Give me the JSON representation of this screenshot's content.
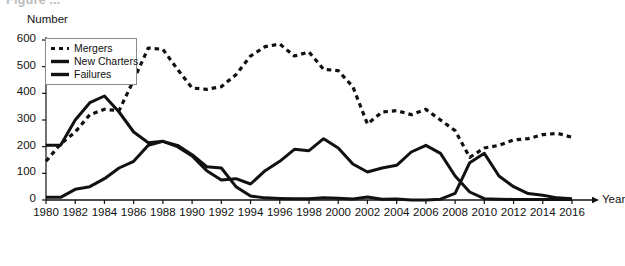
{
  "figure": {
    "cropped_title_fragment": "Figure ..."
  },
  "axes": {
    "ylabel": "Number",
    "xlabel": "Year",
    "yticks": [
      0,
      100,
      200,
      300,
      400,
      500,
      600
    ],
    "xticks": [
      1980,
      1982,
      1984,
      1986,
      1988,
      1990,
      1992,
      1994,
      1996,
      1998,
      2000,
      2002,
      2004,
      2006,
      2008,
      2010,
      2012,
      2014,
      2016
    ]
  },
  "legend": {
    "items": [
      {
        "label": "Mergers",
        "style": "dashed",
        "color": "#111111"
      },
      {
        "label": "New Charters",
        "style": "solid",
        "color": "#111111"
      },
      {
        "label": "Failures",
        "style": "solid",
        "color": "#111111"
      }
    ]
  },
  "chart_data": {
    "type": "line",
    "title": "",
    "xlabel": "Year",
    "ylabel": "Number",
    "xlim": [
      1980,
      2016
    ],
    "ylim": [
      0,
      600
    ],
    "grid": false,
    "legend_position": "top-left",
    "x": [
      1980,
      1981,
      1982,
      1983,
      1984,
      1985,
      1986,
      1987,
      1988,
      1989,
      1990,
      1991,
      1992,
      1993,
      1994,
      1995,
      1996,
      1997,
      1998,
      1999,
      2000,
      2001,
      2002,
      2003,
      2004,
      2005,
      2006,
      2007,
      2008,
      2009,
      2010,
      2011,
      2012,
      2013,
      2014,
      2015,
      2016
    ],
    "series": [
      {
        "name": "Mergers",
        "style": "dashed",
        "color": "#111111",
        "values": [
          145,
          210,
          255,
          320,
          340,
          335,
          450,
          570,
          565,
          490,
          420,
          415,
          425,
          470,
          540,
          575,
          585,
          540,
          555,
          490,
          485,
          425,
          285,
          330,
          335,
          320,
          340,
          300,
          260,
          160,
          195,
          205,
          225,
          230,
          245,
          250,
          235
        ]
      },
      {
        "name": "New Charters",
        "style": "solid",
        "color": "#111111",
        "values": [
          205,
          205,
          300,
          365,
          390,
          330,
          255,
          215,
          220,
          200,
          165,
          110,
          75,
          80,
          60,
          110,
          145,
          190,
          185,
          230,
          195,
          135,
          105,
          120,
          130,
          180,
          205,
          175,
          90,
          30,
          5,
          3,
          2,
          2,
          2,
          2,
          2
        ]
      },
      {
        "name": "Failures",
        "style": "solid",
        "color": "#111111",
        "values": [
          10,
          10,
          40,
          50,
          80,
          120,
          145,
          205,
          220,
          205,
          170,
          125,
          120,
          50,
          15,
          8,
          6,
          5,
          5,
          8,
          7,
          4,
          11,
          3,
          4,
          0,
          0,
          3,
          25,
          140,
          175,
          90,
          50,
          24,
          18,
          8,
          5
        ]
      }
    ]
  }
}
